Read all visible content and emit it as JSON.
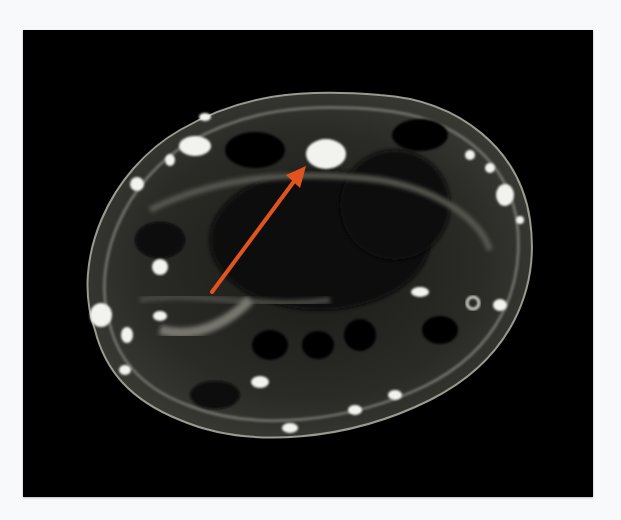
{
  "image": {
    "description": "Axial MRI cross-section of wrist with orange arrow pointing to a bright oval structure",
    "modality": "MRI",
    "background_color": "#f7f9fb",
    "panel_color": "#000000"
  },
  "annotation": {
    "type": "arrow",
    "color": "#e2541f",
    "start": [
      212,
      292
    ],
    "end": [
      304,
      168
    ],
    "target_label": "bright oval lesion"
  }
}
